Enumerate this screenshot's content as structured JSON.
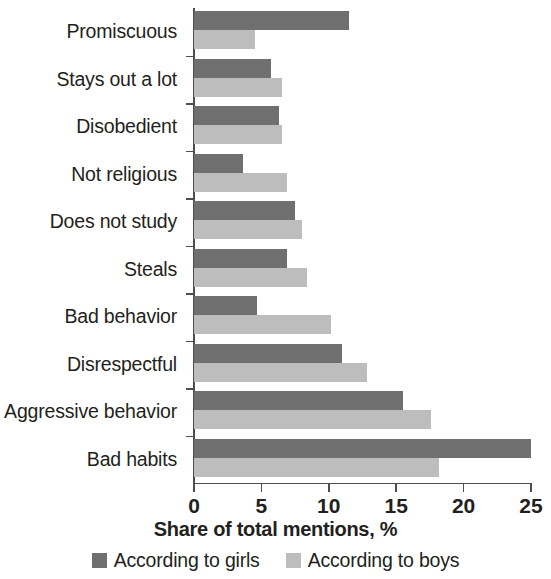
{
  "chart_data": {
    "type": "bar",
    "orientation": "horizontal",
    "title": "",
    "xlabel": "Share of total mentions, %",
    "ylabel": "",
    "xlim": [
      0,
      25
    ],
    "xticks": [
      0,
      5,
      10,
      15,
      20,
      25
    ],
    "xticklabels": [
      "0",
      "5",
      "10",
      "15",
      "20",
      "25"
    ],
    "grid": false,
    "legend_position": "bottom",
    "categories": [
      "Promiscuous",
      "Stays out a lot",
      "Disobedient",
      "Not religious",
      "Does not study",
      "Steals",
      "Bad behavior",
      "Disrespectful",
      "Aggressive behavior",
      "Bad habits"
    ],
    "series": [
      {
        "name": "According to girls",
        "color": "#6f6f6f",
        "values": [
          11.5,
          5.7,
          6.3,
          3.6,
          7.5,
          6.9,
          4.7,
          11.0,
          15.5,
          25.0
        ]
      },
      {
        "name": "According to boys",
        "color": "#bdbdbd",
        "values": [
          4.5,
          6.5,
          6.5,
          6.9,
          8.0,
          8.4,
          10.2,
          12.8,
          17.6,
          18.2
        ]
      }
    ]
  }
}
